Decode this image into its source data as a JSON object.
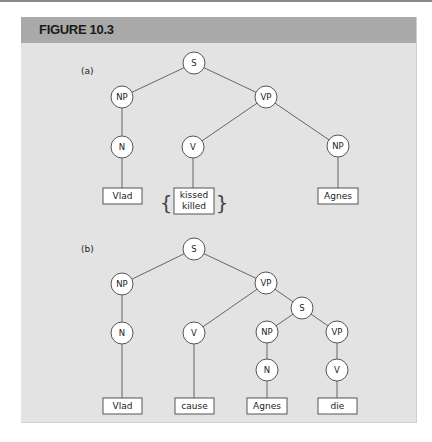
{
  "figure": {
    "title": "FIGURE 10.3",
    "colors": {
      "header": "#a9a9a9",
      "panel": "#e3e3e3",
      "node_fill": "#ffffff",
      "line": "#555555"
    }
  },
  "tree_a": {
    "label": "(a)",
    "nodes": {
      "s": "S",
      "np": "NP",
      "vp": "VP",
      "n": "N",
      "v": "V",
      "np_obj": "NP"
    },
    "leaves": {
      "subject": "Vlad",
      "verb_option_1": "kissed",
      "verb_option_2": "killed",
      "object": "Agnes"
    },
    "braces": {
      "left": "{",
      "right": "}"
    }
  },
  "tree_b": {
    "label": "(b)",
    "nodes": {
      "s": "S",
      "np": "NP",
      "vp": "VP",
      "n": "N",
      "v": "V",
      "s_embedded": "S",
      "np_embedded": "NP",
      "vp_embedded": "VP",
      "n_embedded": "N",
      "v_embedded": "V"
    },
    "leaves": {
      "subject": "Vlad",
      "verb": "cause",
      "embedded_subject": "Agnes",
      "embedded_verb": "die"
    }
  }
}
